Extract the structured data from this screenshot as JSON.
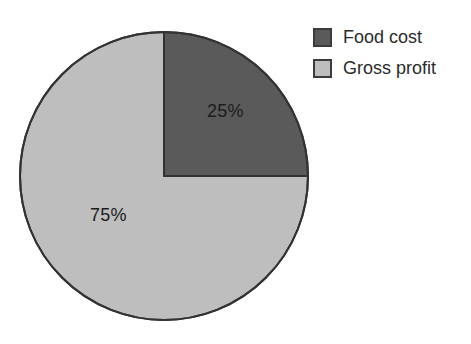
{
  "chart_data": {
    "type": "pie",
    "title": "",
    "subtitle": "",
    "xlabel": "",
    "ylabel": "",
    "categories": [
      "Food cost",
      "Gross profit"
    ],
    "values": [
      25,
      75
    ],
    "value_unit": "%",
    "data_labels": [
      "25%",
      "75%"
    ],
    "colors": [
      "#5a5a5a",
      "#bebebe"
    ],
    "slice_outline_color": "#333333",
    "start_angle_deg": 0,
    "direction": "clockwise",
    "legend_position": "top-right",
    "grid": false,
    "background": "#ffffff",
    "slices": [
      {
        "name": "Food cost",
        "value": 25,
        "label": "25%",
        "color": "#5a5a5a",
        "start_angle_deg": 0,
        "end_angle_deg": 90
      },
      {
        "name": "Gross profit",
        "value": 75,
        "label": "75%",
        "color": "#bebebe",
        "start_angle_deg": 90,
        "end_angle_deg": 360
      }
    ]
  },
  "labels": {
    "food_cost_pct": "25%",
    "gross_profit_pct": "75%"
  },
  "legend": {
    "items": [
      {
        "label": "Food cost",
        "color": "#5a5a5a"
      },
      {
        "label": "Gross profit",
        "color": "#bebebe"
      }
    ]
  }
}
